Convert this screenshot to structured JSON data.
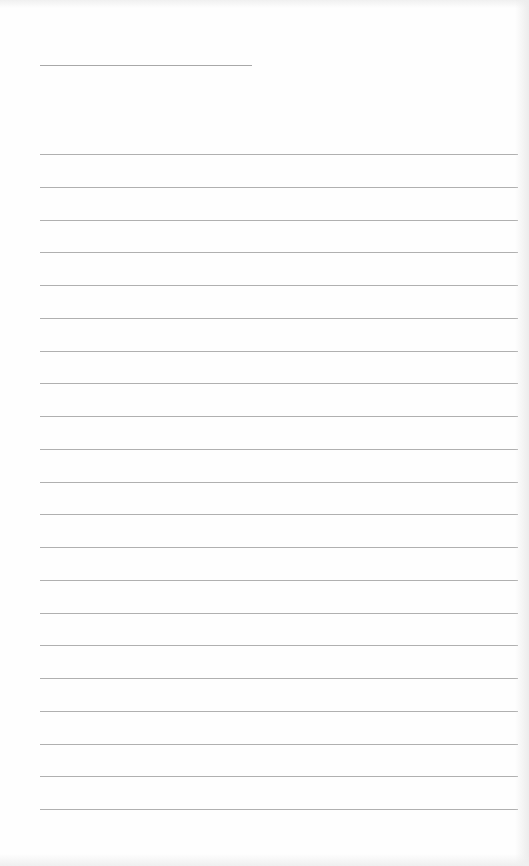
{
  "page": {
    "type": "lined-notepad",
    "background_color": "#fefefe",
    "line_color": "#b0b0b0",
    "title_line": {
      "x": 40,
      "y": 65,
      "width": 212
    },
    "rules": {
      "count": 21,
      "first_y": 154,
      "spacing": 32.75,
      "x": 40,
      "width": 478
    },
    "text": []
  }
}
